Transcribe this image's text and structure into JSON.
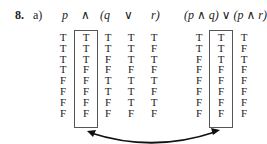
{
  "problem": {
    "number": "8.",
    "part": "a)"
  },
  "header": {
    "p": "p",
    "and": "∧",
    "q": "(q",
    "or": "∨",
    "r": "r)",
    "rhs": "(p ∧ q) ∨ (p ∧ r)"
  },
  "columns": {
    "p": [
      "T",
      "T",
      "T",
      "T",
      "F",
      "F",
      "F",
      "F"
    ],
    "and": [
      "T",
      "T",
      "T",
      "F",
      "F",
      "F",
      "F",
      "F"
    ],
    "q": [
      "T",
      "T",
      "F",
      "F",
      "T",
      "T",
      "F",
      "F"
    ],
    "or": [
      "T",
      "T",
      "T",
      "F",
      "T",
      "T",
      "T",
      "F"
    ],
    "r": [
      "T",
      "F",
      "T",
      "F",
      "T",
      "F",
      "T",
      "F"
    ],
    "pq": [
      "T",
      "T",
      "F",
      "F",
      "F",
      "F",
      "F",
      "F"
    ],
    "mainor": [
      "T",
      "T",
      "T",
      "F",
      "F",
      "F",
      "F",
      "F"
    ],
    "pr": [
      "T",
      "F",
      "T",
      "F",
      "F",
      "F",
      "F",
      "F"
    ]
  }
}
